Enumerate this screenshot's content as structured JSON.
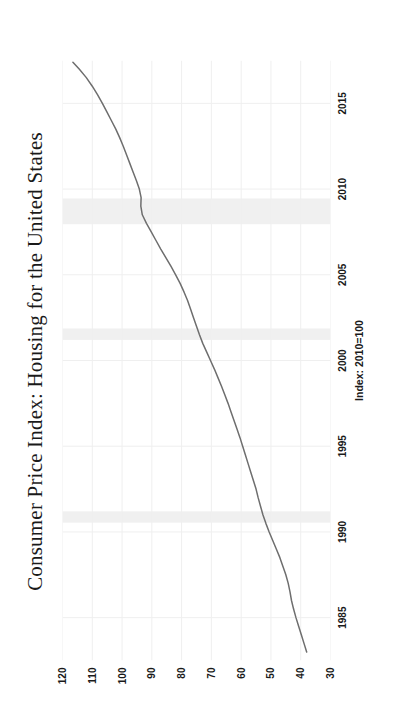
{
  "chart_data": {
    "type": "line",
    "title": "Consumer Price Index: Housing for the United States",
    "xlabel": "",
    "ylabel": "Index: 2010=100",
    "units_label": "Index: 2010=100",
    "xlim": [
      1982.5,
      2017.5
    ],
    "ylim": [
      30,
      120
    ],
    "xticks": [
      1985,
      1990,
      1995,
      2000,
      2005,
      2010,
      2015
    ],
    "xtick_labels": [
      "1985",
      "1990",
      "1995",
      "2000",
      "2005",
      "2010",
      "2015"
    ],
    "yticks": [
      30,
      40,
      50,
      60,
      70,
      80,
      90,
      100,
      110,
      120
    ],
    "ytick_labels": [
      "30",
      "40",
      "50",
      "60",
      "70",
      "80",
      "90",
      "100",
      "110",
      "120"
    ],
    "grid": true,
    "grid_color": "#efefef",
    "legend": false,
    "legend_position": "none",
    "line_color": "#6e6e6e",
    "line_width": 1.5,
    "recession_band_color": "#f0f0f0",
    "recession_bands": [
      {
        "start": 1990.54,
        "end": 1991.2
      },
      {
        "start": 2001.2,
        "end": 2001.87
      },
      {
        "start": 2007.95,
        "end": 2009.45
      }
    ],
    "series": [
      {
        "name": "Consumer Price Index: Housing for the United States",
        "x": [
          1983.0,
          1983.5,
          1984.0,
          1984.5,
          1985.0,
          1985.5,
          1986.0,
          1986.5,
          1987.0,
          1987.5,
          1988.0,
          1988.5,
          1989.0,
          1989.5,
          1990.0,
          1990.5,
          1991.0,
          1991.5,
          1992.0,
          1992.5,
          1993.0,
          1993.5,
          1994.0,
          1994.5,
          1995.0,
          1995.5,
          1996.0,
          1996.5,
          1997.0,
          1997.5,
          1998.0,
          1998.5,
          1999.0,
          1999.5,
          2000.0,
          2000.5,
          2001.0,
          2001.5,
          2002.0,
          2002.5,
          2003.0,
          2003.5,
          2004.0,
          2004.5,
          2005.0,
          2005.5,
          2006.0,
          2006.5,
          2007.0,
          2007.5,
          2008.0,
          2008.5,
          2009.0,
          2009.5,
          2010.0,
          2010.5,
          2011.0,
          2011.5,
          2012.0,
          2012.5,
          2013.0,
          2013.5,
          2014.0,
          2014.5,
          2015.0,
          2015.5,
          2016.0,
          2016.5,
          2017.0,
          2017.4
        ],
        "y": [
          38.0,
          38.9,
          39.8,
          40.7,
          41.6,
          42.4,
          43.1,
          43.6,
          44.2,
          45.0,
          46.0,
          47.0,
          48.2,
          49.4,
          50.6,
          51.7,
          52.7,
          53.5,
          54.3,
          55.0,
          55.9,
          56.8,
          57.7,
          58.6,
          59.5,
          60.4,
          61.4,
          62.4,
          63.4,
          64.4,
          65.5,
          66.6,
          67.8,
          69.0,
          70.3,
          71.6,
          72.9,
          74.0,
          75.0,
          76.0,
          77.0,
          78.0,
          79.2,
          80.5,
          82.0,
          83.6,
          85.3,
          87.0,
          88.6,
          90.2,
          91.8,
          93.2,
          93.7,
          93.6,
          94.2,
          95.2,
          96.3,
          97.4,
          98.5,
          99.6,
          100.8,
          102.1,
          103.6,
          105.1,
          106.6,
          108.2,
          110.0,
          112.0,
          114.4,
          116.5
        ]
      }
    ]
  },
  "axis": {
    "units_text": "Index: 2010=100"
  },
  "source": {
    "text": ""
  }
}
